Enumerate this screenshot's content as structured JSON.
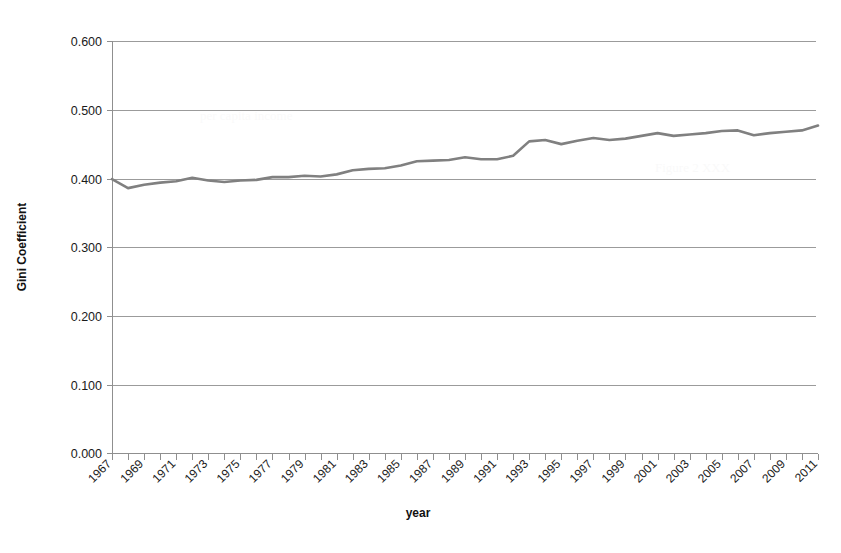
{
  "chart_data": {
    "type": "line",
    "title": "",
    "subtitle": "",
    "xlabel": "year",
    "ylabel": "Gini Coefficient",
    "xlim": [
      1967,
      2011
    ],
    "ylim": [
      0.0,
      0.6
    ],
    "grid": true,
    "legend": false,
    "legend_position": "none",
    "line_color": "#808080",
    "y_tick_labels": [
      "0.600",
      "0.500",
      "0.400",
      "0.300",
      "0.200",
      "0.100",
      "0.000"
    ],
    "y_tick_values": [
      0.6,
      0.5,
      0.4,
      0.3,
      0.2,
      0.1,
      0.0
    ],
    "x_tick_labels": [
      "1967",
      "1969",
      "1971",
      "1973",
      "1975",
      "1977",
      "1979",
      "1981",
      "1983",
      "1985",
      "1987",
      "1989",
      "1991",
      "1993",
      "1995",
      "1997",
      "1999",
      "2001",
      "2003",
      "2005",
      "2007",
      "2009",
      "2011"
    ],
    "x_tick_label_rotation": 45,
    "x_minor_ticks_every_years": 1,
    "x": [
      1967,
      1968,
      1969,
      1970,
      1971,
      1972,
      1973,
      1974,
      1975,
      1976,
      1977,
      1978,
      1979,
      1980,
      1981,
      1982,
      1983,
      1984,
      1985,
      1986,
      1987,
      1988,
      1989,
      1990,
      1991,
      1992,
      1993,
      1994,
      1995,
      1996,
      1997,
      1998,
      1999,
      2000,
      2001,
      2002,
      2003,
      2004,
      2005,
      2006,
      2007,
      2008,
      2009,
      2010,
      2011
    ],
    "series": [
      {
        "name": "Gini Coefficient",
        "color": "#808080",
        "values": [
          0.399,
          0.386,
          0.391,
          0.394,
          0.396,
          0.401,
          0.397,
          0.395,
          0.397,
          0.398,
          0.402,
          0.402,
          0.404,
          0.403,
          0.406,
          0.412,
          0.414,
          0.415,
          0.419,
          0.425,
          0.426,
          0.427,
          0.431,
          0.428,
          0.428,
          0.433,
          0.454,
          0.456,
          0.45,
          0.455,
          0.459,
          0.456,
          0.458,
          0.462,
          0.466,
          0.462,
          0.464,
          0.466,
          0.469,
          0.47,
          0.463,
          0.466,
          0.468,
          0.47,
          0.477
        ]
      }
    ]
  },
  "background_text": {
    "lines": [
      "per capita income",
      "Figure 2 XXX"
    ]
  }
}
